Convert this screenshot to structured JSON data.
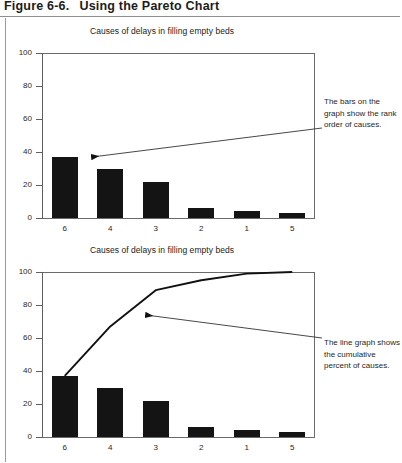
{
  "figure": {
    "number": "Figure 6-6.",
    "title": "Using the Pareto Chart"
  },
  "charts": [
    {
      "id": "pareto-bars",
      "title": "Causes of delays in filling empty beds"
    },
    {
      "id": "pareto-with-cumulative-line",
      "title": "Causes of delays in filling empty beds"
    }
  ],
  "annotations": [
    {
      "id": "bars-callout",
      "text": "The bars on the graph show the rank order of causes."
    },
    {
      "id": "line-callout",
      "text": "The line graph shows the cumulative percent of causes."
    }
  ],
  "chart_data": [
    {
      "type": "bar",
      "title": "Causes of delays in filling empty beds",
      "xlabel": "",
      "ylabel": "",
      "categories": [
        "6",
        "4",
        "3",
        "2",
        "1",
        "5"
      ],
      "values": [
        37,
        30,
        22,
        6,
        4,
        3
      ],
      "ylim": [
        0,
        100
      ],
      "yticks": [
        0,
        20,
        40,
        60,
        80,
        100
      ],
      "grid": false,
      "legend": "none",
      "bar_color": "#141414"
    },
    {
      "type": "bar",
      "title": "Causes of delays in filling empty beds",
      "xlabel": "",
      "ylabel": "",
      "categories": [
        "6",
        "4",
        "3",
        "2",
        "1",
        "5"
      ],
      "values": [
        37,
        30,
        22,
        6,
        4,
        3
      ],
      "ylim": [
        0,
        100
      ],
      "yticks": [
        0,
        20,
        40,
        60,
        80,
        100
      ],
      "grid": false,
      "legend": "none",
      "bar_color": "#141414",
      "series": [
        {
          "name": "Cumulative percent",
          "type": "line",
          "values": [
            37,
            67,
            89,
            95,
            99,
            100
          ],
          "color": "#111111"
        }
      ]
    }
  ]
}
